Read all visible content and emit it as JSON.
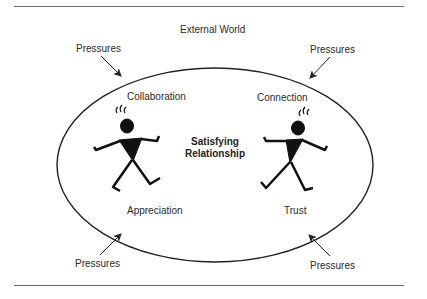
{
  "diagram": {
    "outer_label": "External World",
    "center_label_line1": "Satisfying",
    "center_label_line2": "Relationship",
    "pressures": {
      "top_left": "Pressures",
      "top_right": "Pressures",
      "bottom_left": "Pressures",
      "bottom_right": "Pressures"
    },
    "quadrants": {
      "top_left": "Collaboration",
      "top_right": "Connection",
      "bottom_left": "Appreciation",
      "bottom_right": "Trust"
    },
    "figures": [
      "person-left",
      "person-right"
    ],
    "colors": {
      "line": "#222222",
      "rule": "#6b6b6b",
      "background": "#ffffff"
    }
  }
}
